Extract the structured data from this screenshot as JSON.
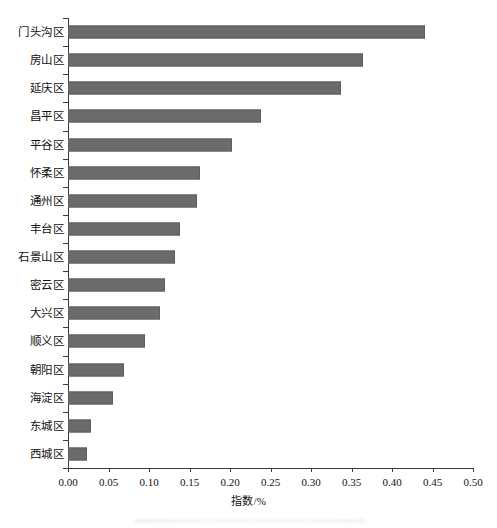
{
  "chart_data": {
    "type": "bar",
    "orientation": "horizontal",
    "title": "",
    "xlabel": "指数/%",
    "ylabel": "",
    "xlim": [
      0.0,
      0.5
    ],
    "xticks": [
      "0.00",
      "0.05",
      "0.10",
      "0.15",
      "0.20",
      "0.25",
      "0.30",
      "0.35",
      "0.40",
      "0.45",
      "0.50"
    ],
    "xtick_values": [
      0.0,
      0.05,
      0.1,
      0.15,
      0.2,
      0.25,
      0.3,
      0.35,
      0.4,
      0.45,
      0.5
    ],
    "grid": false,
    "legend": false,
    "bar_color": "#6b6b6b",
    "axis_color": "#3a3a3a",
    "categories": [
      "门头沟区",
      "房山区",
      "延庆区",
      "昌平区",
      "平谷区",
      "怀柔区",
      "通州区",
      "丰台区",
      "石景山区",
      "密云区",
      "大兴区",
      "顺义区",
      "朝阳区",
      "海淀区",
      "东城区",
      "西城区"
    ],
    "values": [
      0.441,
      0.364,
      0.337,
      0.238,
      0.203,
      0.163,
      0.159,
      0.138,
      0.132,
      0.12,
      0.114,
      0.095,
      0.069,
      0.055,
      0.029,
      0.024
    ]
  }
}
